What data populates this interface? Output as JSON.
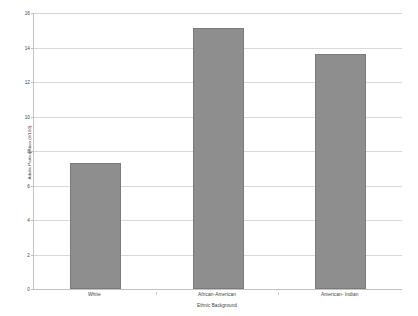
{
  "chart_data": {
    "type": "bar",
    "title": "",
    "subtitle": "",
    "categories": [
      "White",
      "African-American",
      "American- Indian"
    ],
    "values": [
      7.33,
      15.15,
      13.65
    ],
    "series": [
      {
        "name": "Adults Participation",
        "values": [
          7.33,
          15.15,
          13.65
        ]
      }
    ],
    "xlabel": "Ethnic Background",
    "ylabel": "Adults Participation (#/100)",
    "ylim": [
      0,
      16
    ],
    "ytick_labels": [
      "0",
      "2",
      "4",
      "6",
      "8",
      "10",
      "12",
      "14",
      "16"
    ],
    "ytick_values": [
      0,
      2,
      4,
      6,
      8,
      10,
      12,
      14,
      16
    ],
    "grid": true,
    "legend": false,
    "legend_position": "none",
    "bar_color": "#8e8e8e",
    "bar_border_color": "#7b7b7b",
    "gridline_color": "#d9d9d9",
    "axis_color": "#c2c2c2",
    "background_color": "#ffffff"
  }
}
